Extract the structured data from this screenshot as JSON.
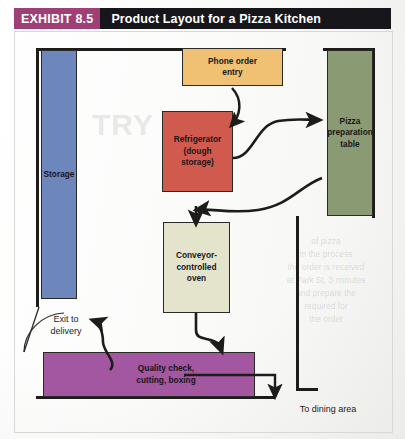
{
  "header": {
    "badge": "EXHIBIT 8.5",
    "title": "Product Layout for a Pizza Kitchen",
    "badge_color": "#9e3f76",
    "title_bg_color": "#17161a"
  },
  "diagram": {
    "type": "facility-layout",
    "watermark_large": "TRY",
    "watermark_block": "of pizza\nin the process\nthe order is received\nat Park St, 3 minutes\nand prepare the\nrequired for\nthe order",
    "boxes": [
      {
        "id": "storage",
        "label": "Storage",
        "color": "#6d87bd",
        "x": 41,
        "y": 50,
        "w": 36,
        "h": 249
      },
      {
        "id": "phone",
        "label": "Phone order\nentry",
        "color": "#f0c173",
        "x": 182,
        "y": 48,
        "w": 101,
        "h": 38
      },
      {
        "id": "fridge",
        "label": "Refrigerator\n(dough\nstorage)",
        "color": "#d15a4e",
        "x": 162,
        "y": 111,
        "w": 71,
        "h": 81
      },
      {
        "id": "pizza",
        "label": "Pizza\npreparation\ntable",
        "color": "#8a9b74",
        "x": 327,
        "y": 50,
        "w": 46,
        "h": 166
      },
      {
        "id": "oven",
        "label": "Conveyor-\ncontrolled\noven",
        "color": "#e4e4cd",
        "x": 163,
        "y": 222,
        "w": 67,
        "h": 91
      },
      {
        "id": "quality",
        "label": "Quality check,\ncutting, boxing",
        "color": "#a257a0",
        "x": 43,
        "y": 352,
        "w": 212,
        "h": 45
      }
    ],
    "labels": [
      {
        "id": "exit",
        "text": "Exit to\ndelivery"
      },
      {
        "id": "dining",
        "text": "To dining area"
      }
    ],
    "box_labels": {
      "storage_label": "Storage",
      "phone_line1": "Phone order",
      "phone_line2": "entry",
      "fridge_line1": "Refrigerator",
      "fridge_line2": "(dough",
      "fridge_line3": "storage)",
      "pizza_line1": "Pizza",
      "pizza_line2": "preparation",
      "pizza_line3": "table",
      "oven_line1": "Conveyor-",
      "oven_line2": "controlled",
      "oven_line3": "oven",
      "quality_line1": "Quality check,",
      "quality_line2": "cutting, boxing",
      "exit_line1": "Exit to",
      "exit_line2": "delivery",
      "dining_label": "To dining area"
    },
    "flow_arrows": [
      {
        "from": "phone",
        "to": "fridge",
        "style": "curved"
      },
      {
        "from": "fridge",
        "to": "pizza",
        "style": "curved"
      },
      {
        "from": "pizza",
        "to": "oven",
        "style": "curved"
      },
      {
        "from": "oven",
        "to": "quality",
        "style": "curved"
      },
      {
        "from": "quality",
        "to": "exit",
        "style": "curved"
      },
      {
        "from": "quality",
        "to": "dining",
        "style": "orthogonal"
      }
    ],
    "wall_color": "#1d1c1b"
  }
}
